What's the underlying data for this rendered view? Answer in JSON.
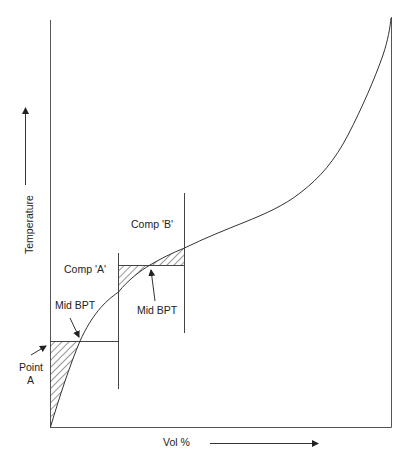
{
  "diagram": {
    "type": "distillation-curve",
    "axes": {
      "y_label": "Temperature",
      "x_label": "Vol %"
    },
    "components": [
      {
        "label": "Comp 'A'",
        "mid_label": "Mid BPT"
      },
      {
        "label": "Comp 'B'",
        "mid_label": "Mid BPT"
      }
    ],
    "point_a": {
      "label_line1": "Point",
      "label_line2": "A"
    },
    "colors": {
      "line": "#333333",
      "hatch": "#333333",
      "background": "#ffffff"
    }
  }
}
